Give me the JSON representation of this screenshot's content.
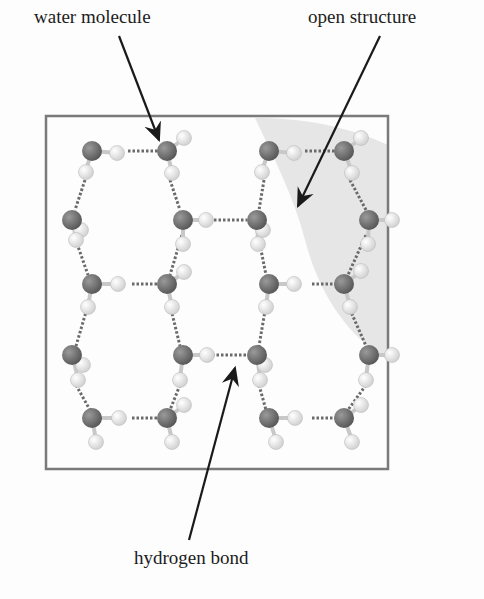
{
  "labels": {
    "water_molecule": "water molecule",
    "open_structure": "open structure",
    "hydrogen_bond": "hydrogen bond"
  },
  "colors": {
    "oxygen": "#6e6e6e",
    "hydrogen": "#eeeeee",
    "frame": "#7a7a7a",
    "shade": "#e4e4e4",
    "bond": "#6a6a6a",
    "arrow": "#1a1a1a"
  },
  "diagram": {
    "type": "ice hydrogen-bond lattice",
    "molecule_count": 20,
    "oxygen_positions": [
      [
        92,
        151
      ],
      [
        167,
        151
      ],
      [
        269,
        151
      ],
      [
        344,
        151
      ],
      [
        72,
        220
      ],
      [
        183,
        220
      ],
      [
        257,
        220
      ],
      [
        369,
        220
      ],
      [
        92,
        284
      ],
      [
        167,
        284
      ],
      [
        269,
        284
      ],
      [
        344,
        284
      ],
      [
        72,
        355
      ],
      [
        183,
        355
      ],
      [
        257,
        355
      ],
      [
        369,
        355
      ],
      [
        92,
        418
      ],
      [
        167,
        418
      ],
      [
        269,
        418
      ],
      [
        344,
        418
      ]
    ]
  }
}
